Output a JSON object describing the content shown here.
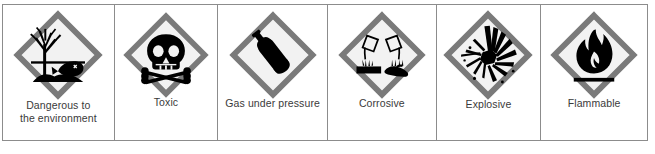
{
  "table": {
    "border_color": "#8c8c8c",
    "background": "#ffffff",
    "caption_color": "#3a3a3a",
    "diamond_border_color": "#7a7a7a",
    "diamond_fill_color": "#f2f2f2",
    "symbol_color": "#000000",
    "cells": [
      {
        "label": "Dangerous to\nthe environment",
        "icon": "dangerous-to-the-environment-pictogram",
        "symbol_description": "dead tree and dead fish over water"
      },
      {
        "label": "Toxic",
        "icon": "toxic-pictogram",
        "symbol_description": "skull and crossbones"
      },
      {
        "label": "Gas under pressure",
        "icon": "gas-under-pressure-pictogram",
        "symbol_description": "gas cylinder"
      },
      {
        "label": "Corrosive",
        "icon": "corrosive-pictogram",
        "symbol_description": "two test tubes pouring liquid onto a surface and a hand"
      },
      {
        "label": "Explosive",
        "icon": "explosive-pictogram",
        "symbol_description": "exploding bomb"
      },
      {
        "label": "Flammable",
        "icon": "flammable-pictogram",
        "symbol_description": "flame over a line"
      }
    ]
  }
}
